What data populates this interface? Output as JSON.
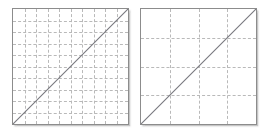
{
  "figure": {
    "title": "",
    "background_color": "#ffffff",
    "width": 266,
    "height": 131,
    "panel_count": 2
  },
  "style": {
    "panel_border_color": "#8c8c8c",
    "panel_background_color": "#ffffff",
    "grid_color": "#b9b9b9",
    "grid_style": "dashed",
    "line_color": "#77777d"
  },
  "chart_data": [
    {
      "type": "line",
      "name": "fine-grid-panel",
      "title": "",
      "subtitle": "",
      "xlabel": "",
      "ylabel": "",
      "xlim": [
        0,
        10
      ],
      "ylim": [
        0,
        10
      ],
      "grid": true,
      "grid_divisions_x": 10,
      "grid_divisions_y": 10,
      "xticks": [
        0,
        1,
        2,
        3,
        4,
        5,
        6,
        7,
        8,
        9,
        10
      ],
      "yticks": [
        0,
        1,
        2,
        3,
        4,
        5,
        6,
        7,
        8,
        9,
        10
      ],
      "xticklabels": [],
      "yticklabels": [],
      "legend": [],
      "legend_position": "none",
      "annotations": [],
      "series": [
        {
          "name": "identity",
          "x": [
            0,
            10
          ],
          "y": [
            0,
            10
          ]
        }
      ]
    },
    {
      "type": "line",
      "name": "coarse-grid-panel",
      "title": "",
      "subtitle": "",
      "xlabel": "",
      "ylabel": "",
      "xlim": [
        0,
        4
      ],
      "ylim": [
        0,
        4
      ],
      "grid": true,
      "grid_divisions_x": 4,
      "grid_divisions_y": 4,
      "xticks": [
        0,
        1,
        2,
        3,
        4
      ],
      "yticks": [
        0,
        1,
        2,
        3,
        4
      ],
      "xticklabels": [],
      "yticklabels": [],
      "legend": [],
      "legend_position": "none",
      "annotations": [],
      "series": [
        {
          "name": "identity",
          "x": [
            0,
            4
          ],
          "y": [
            0,
            4
          ]
        }
      ]
    }
  ]
}
